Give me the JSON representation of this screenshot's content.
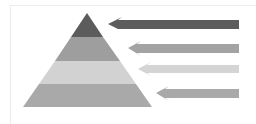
{
  "diagram": {
    "type": "pyramid-with-arrows",
    "layers": [
      {
        "name": "layer-1-top",
        "color": "#5c5c5c"
      },
      {
        "name": "layer-2",
        "color": "#9e9e9e"
      },
      {
        "name": "layer-3",
        "color": "#d2d2d2"
      },
      {
        "name": "layer-4-base",
        "color": "#a9a9a9"
      }
    ],
    "arrows": [
      {
        "name": "arrow-1",
        "color": "#5c5c5c",
        "direction": "left"
      },
      {
        "name": "arrow-2",
        "color": "#a3a3a3",
        "direction": "left"
      },
      {
        "name": "arrow-3",
        "color": "#d4d4d4",
        "direction": "left"
      },
      {
        "name": "arrow-4",
        "color": "#a9a9a9",
        "direction": "left"
      }
    ]
  }
}
